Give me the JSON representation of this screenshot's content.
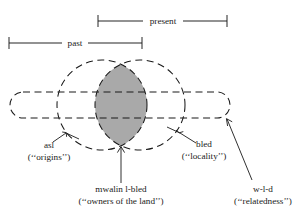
{
  "figure": {
    "title": "",
    "background_color": "#ffffff",
    "ink_color": "#1a1a1a",
    "shade_color": "#a9a9a9"
  },
  "spans": {
    "present": {
      "label": "present",
      "x_start": 98,
      "x_end": 227,
      "y": 21
    },
    "past": {
      "label": "past",
      "x_start": 9,
      "x_end": 142,
      "y": 43
    }
  },
  "sets": {
    "left_circle": {
      "name": "asl",
      "cx": 102,
      "cy": 105,
      "r": 45
    },
    "right_circle": {
      "name": "bled",
      "cx": 140,
      "cy": 105,
      "r": 45
    },
    "stadium": {
      "name": "w-l-d",
      "x": 10,
      "y": 92,
      "width": 220,
      "height": 26
    },
    "lens": {
      "name": "mwalin l-bled",
      "shaded": true
    }
  },
  "labels": {
    "asl": {
      "term": "asl",
      "gloss": "(‘‘origins’’)"
    },
    "bled": {
      "term": "bled",
      "gloss": "(‘‘locality’’)"
    },
    "mwalin": {
      "term": "mwalin l-bled",
      "gloss": "(‘‘owners of the land’’)"
    },
    "wld": {
      "term": "w-l-d",
      "gloss": "(‘‘relatedness’’)"
    }
  }
}
